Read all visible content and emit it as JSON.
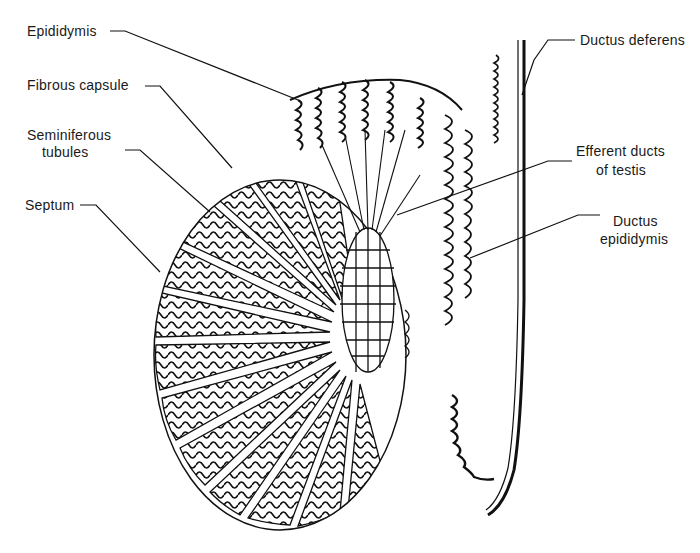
{
  "diagram": {
    "labels": {
      "epididymis": "Epididymis",
      "fibrous_capsule": "Fibrous capsule",
      "seminiferous_tubules_line1": "Seminiferous",
      "seminiferous_tubules_line2": "tubules",
      "septum": "Septum",
      "ductus_deferens": "Ductus deferens",
      "efferent_ducts_line1": "Efferent ducts",
      "efferent_ducts_line2": "of testis",
      "ductus_epididymis_line1": "Ductus",
      "ductus_epididymis_line2": "epididymis"
    },
    "colors": {
      "background": "#ffffff",
      "ink": "#111111"
    }
  }
}
